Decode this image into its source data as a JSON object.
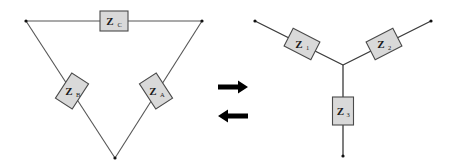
{
  "diagram": {
    "type": "delta-wye-transformation",
    "colors": {
      "wire": "#555555",
      "box_fill": "#d9d9d9",
      "box_stroke": "#4a4a4a",
      "arrow": "#000000",
      "node": "#111111"
    },
    "delta": {
      "nodes": [
        {
          "id": "top-left",
          "x": 26,
          "y": 21
        },
        {
          "id": "top-right",
          "x": 202,
          "y": 21
        },
        {
          "id": "bottom",
          "x": 115,
          "y": 158
        }
      ],
      "impedances": [
        {
          "id": "ZC",
          "symbol": "Z",
          "subscript": "C",
          "cx": 114,
          "cy": 21,
          "angle": 0
        },
        {
          "id": "ZB",
          "symbol": "Z",
          "subscript": "B",
          "cx": 72,
          "cy": 91,
          "angle": -57
        },
        {
          "id": "ZA",
          "symbol": "Z",
          "subscript": "A",
          "cx": 156,
          "cy": 91,
          "angle": 57
        }
      ]
    },
    "arrows": [
      {
        "id": "delta-to-wye",
        "direction": "right",
        "x1": 218,
        "x2": 248,
        "y": 87
      },
      {
        "id": "wye-to-delta",
        "direction": "left",
        "x1": 218,
        "x2": 248,
        "y": 116
      }
    ],
    "wye": {
      "center": {
        "x": 343,
        "y": 65
      },
      "nodes": [
        {
          "id": "left",
          "x": 255,
          "y": 21
        },
        {
          "id": "right",
          "x": 431,
          "y": 21
        },
        {
          "id": "bottom",
          "x": 343,
          "y": 156
        }
      ],
      "impedances": [
        {
          "id": "Z1",
          "symbol": "Z",
          "subscript": "1",
          "cx": 302,
          "cy": 44,
          "angle": 27
        },
        {
          "id": "Z2",
          "symbol": "Z",
          "subscript": "2",
          "cx": 384,
          "cy": 44,
          "angle": -27
        },
        {
          "id": "Z3",
          "symbol": "Z",
          "subscript": "3",
          "cx": 343,
          "cy": 111,
          "angle": 90
        }
      ]
    }
  }
}
